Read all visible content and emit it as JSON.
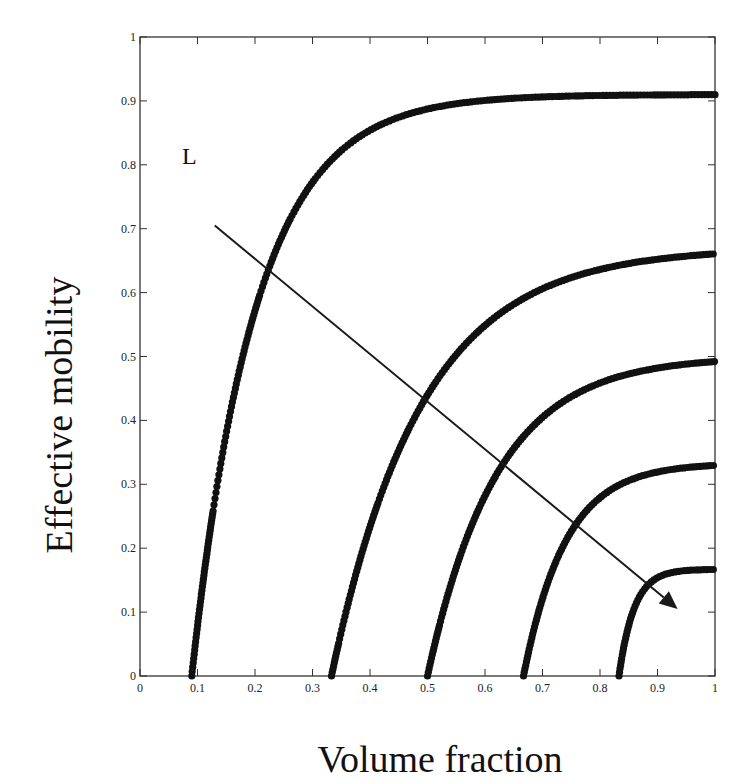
{
  "chart_data": {
    "type": "scatter",
    "title": "",
    "xlabel": "Volume fraction",
    "ylabel": "Effective mobility",
    "xlim": [
      0,
      1
    ],
    "ylim": [
      0,
      1
    ],
    "grid": false,
    "legend": null,
    "x_ticks": [
      "0",
      "0.1",
      "0.2",
      "0.3",
      "0.4",
      "0.5",
      "0.6",
      "0.7",
      "0.8",
      "0.9",
      "1"
    ],
    "y_ticks": [
      "0",
      "0.1",
      "0.2",
      "0.3",
      "0.4",
      "0.5",
      "0.6",
      "0.7",
      "0.8",
      "0.9",
      "1"
    ],
    "annotations": [
      {
        "text": "L",
        "x": 0.08,
        "y": 0.77
      },
      {
        "type": "arrow",
        "from": [
          0.13,
          0.705
        ],
        "to": [
          0.935,
          0.105
        ],
        "label": "L"
      }
    ],
    "series": [
      {
        "name": "curve-1",
        "x0": 0.09,
        "plateau": 0.91,
        "k": 9.0,
        "points": [
          [
            0.09,
            0.0
          ],
          [
            0.1,
            0.1
          ],
          [
            0.12,
            0.25
          ],
          [
            0.15,
            0.41
          ],
          [
            0.18,
            0.51
          ],
          [
            0.22,
            0.63
          ],
          [
            0.3,
            0.76
          ],
          [
            0.4,
            0.84
          ],
          [
            0.5,
            0.87
          ],
          [
            0.6,
            0.89
          ],
          [
            0.7,
            0.9
          ],
          [
            0.8,
            0.91
          ],
          [
            0.9,
            0.91
          ],
          [
            1.0,
            0.91
          ]
        ]
      },
      {
        "name": "curve-2",
        "x0": 0.333,
        "plateau": 0.67,
        "k": 6.4,
        "points": [
          [
            0.333,
            0.0
          ],
          [
            0.36,
            0.1
          ],
          [
            0.4,
            0.23
          ],
          [
            0.45,
            0.35
          ],
          [
            0.49,
            0.43
          ],
          [
            0.55,
            0.51
          ],
          [
            0.6,
            0.56
          ],
          [
            0.7,
            0.62
          ],
          [
            0.8,
            0.65
          ],
          [
            0.9,
            0.665
          ],
          [
            1.0,
            0.67
          ]
        ]
      },
      {
        "name": "curve-3",
        "x0": 0.5,
        "plateau": 0.5,
        "k": 8.3,
        "points": [
          [
            0.5,
            0.0
          ],
          [
            0.52,
            0.08
          ],
          [
            0.55,
            0.17
          ],
          [
            0.6,
            0.28
          ],
          [
            0.63,
            0.33
          ],
          [
            0.7,
            0.41
          ],
          [
            0.8,
            0.47
          ],
          [
            0.9,
            0.495
          ],
          [
            1.0,
            0.5
          ]
        ]
      },
      {
        "name": "curve-4",
        "x0": 0.667,
        "plateau": 0.333,
        "k": 13.7,
        "points": [
          [
            0.667,
            0.0
          ],
          [
            0.69,
            0.1
          ],
          [
            0.72,
            0.17
          ],
          [
            0.757,
            0.236
          ],
          [
            0.8,
            0.28
          ],
          [
            0.85,
            0.31
          ],
          [
            0.9,
            0.325
          ],
          [
            1.0,
            0.333
          ]
        ]
      },
      {
        "name": "curve-5",
        "x0": 0.833,
        "plateau": 0.167,
        "k": 38.0,
        "points": [
          [
            0.833,
            0.0
          ],
          [
            0.845,
            0.06
          ],
          [
            0.86,
            0.11
          ],
          [
            0.883,
            0.143
          ],
          [
            0.92,
            0.16
          ],
          [
            0.96,
            0.166
          ],
          [
            1.0,
            0.167
          ]
        ]
      }
    ]
  },
  "plot_area": {
    "left": 140,
    "right": 715,
    "top": 37,
    "bottom": 676
  },
  "colors": {
    "dots": "#111111",
    "axis": "#333333",
    "arrow": "#1a1a1a"
  }
}
